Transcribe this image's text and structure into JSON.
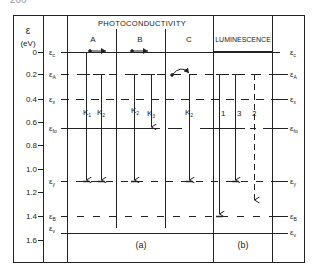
{
  "page_fragment": "206",
  "axis": {
    "symbol": "ε",
    "unit": "(eV)",
    "ticks": [
      "0",
      "0.2",
      "0.4",
      "0.6",
      "0.8",
      "1.0",
      "1.2",
      "1.4",
      "1.6"
    ]
  },
  "levels": {
    "c": {
      "label": "ε",
      "sub": "c"
    },
    "A": {
      "label": "ε",
      "sub": "A"
    },
    "x": {
      "label": "ε",
      "sub": "x"
    },
    "fo": {
      "label": "ε",
      "sub": "fo"
    },
    "y": {
      "label": "ε",
      "sub": "y"
    },
    "B": {
      "label": "ε",
      "sub": "B"
    },
    "v": {
      "label": "ε",
      "sub": "v"
    }
  },
  "headers": {
    "photoconductivity": "PHOTOCONDUCTIVITY",
    "luminescence": "LUMINESCENCE",
    "col_a": "A",
    "col_b": "B",
    "col_c": "C"
  },
  "transitions": {
    "k1": "K",
    "k1_sub": "1",
    "k2a": "K",
    "k2a_sub": "2",
    "k2b": "K",
    "k2b_sub": "2",
    "k3": "K",
    "k3_sub": "3",
    "k2c": "K",
    "k2c_sub": "2",
    "lum1": "1",
    "lum3": "3",
    "lum2": "2"
  },
  "panels": {
    "a": "(a)",
    "b": "(b)"
  }
}
